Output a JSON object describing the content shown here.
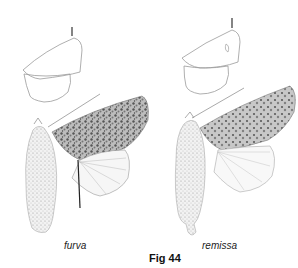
{
  "figure": {
    "title": "Fig 44",
    "specimens": [
      {
        "name": "furva",
        "label": "furva"
      },
      {
        "name": "remissa",
        "label": "remissa"
      }
    ]
  },
  "colors": {
    "line": "#9a9a9a",
    "wing_dark": "#6b6b6b",
    "wing_mid": "#a8a8a8",
    "body": "#c8c8c8"
  }
}
